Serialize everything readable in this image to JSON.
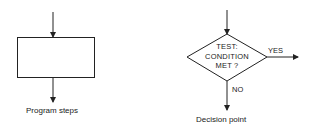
{
  "diagram": {
    "colors": {
      "stroke": "#222222",
      "background": "#ffffff",
      "text": "#222222"
    },
    "program_steps": {
      "shape": "rectangle",
      "caption": "Program steps"
    },
    "decision_point": {
      "shape": "diamond",
      "text_lines": [
        "TEST:",
        "CONDITION",
        "MET ?"
      ],
      "yes_label": "YES",
      "no_label": "NO",
      "caption": "Decision point"
    }
  }
}
